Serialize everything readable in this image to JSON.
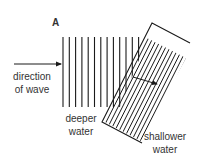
{
  "figure": {
    "panel_label": "A",
    "labels": {
      "direction_line1": "direction",
      "direction_line2": "of wave",
      "deeper_line1": "deeper",
      "deeper_line2": "water",
      "shallower_line1": "shallower",
      "shallower_line2": "water"
    },
    "colors": {
      "line": "#1a1a1a",
      "text": "#333333",
      "background": "#ffffff"
    },
    "deep_wavefronts": {
      "count": 13,
      "x_start": 63,
      "spacing": 6.3,
      "y_top": 37,
      "y_bottom": 107
    },
    "shallow_wavefronts": {
      "count": 20,
      "spacing": 3.9
    }
  }
}
